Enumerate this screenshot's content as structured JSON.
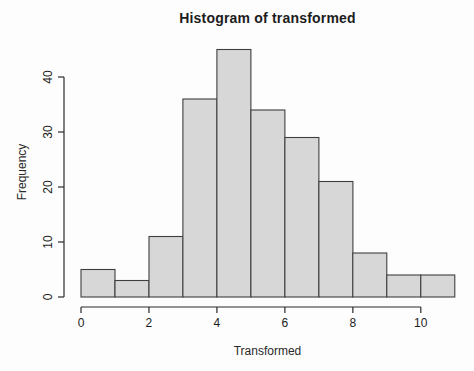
{
  "figure": {
    "title": "Histogram of transformed",
    "xlabel": "Transformed",
    "ylabel": "Frequency"
  },
  "chart_data": {
    "type": "bar",
    "subtype": "histogram",
    "title": "Histogram of transformed",
    "xlabel": "Transformed",
    "ylabel": "Frequency",
    "bin_edges": [
      0,
      1,
      2,
      3,
      4,
      5,
      6,
      7,
      8,
      9,
      10,
      11
    ],
    "frequencies": [
      5,
      3,
      11,
      36,
      45,
      34,
      29,
      21,
      8,
      4,
      4
    ],
    "total_count": 200,
    "x_ticks": [
      0,
      2,
      4,
      6,
      8,
      10
    ],
    "y_ticks": [
      0,
      10,
      20,
      30,
      40
    ],
    "xlim": [
      0,
      11
    ],
    "ylim": [
      0,
      45
    ],
    "grid": false,
    "legend": null,
    "bar_fill": "#d7d7d7",
    "bar_stroke": "#3f3f3f",
    "axis_color": "#2b2b2b",
    "text_color": "#1c1c1c"
  }
}
